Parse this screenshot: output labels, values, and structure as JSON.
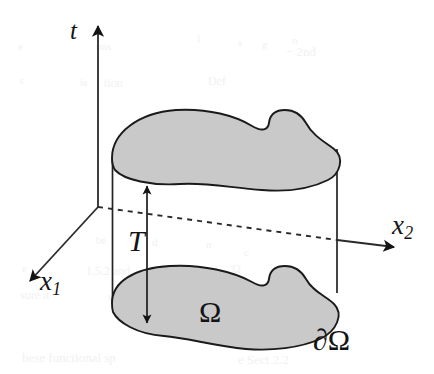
{
  "figure": {
    "kind": "space-time-cylinder",
    "caption": "",
    "width": 434,
    "height": 374,
    "background_color": "#ffffff",
    "ink_color": "#141414",
    "region_fill_color": "#c9c9c9",
    "region_stroke_color": "#1a1a1a"
  },
  "axes": {
    "origin": {
      "x": 98,
      "y": 207
    },
    "items": [
      {
        "id": "t",
        "label": "t",
        "name": "axis-t",
        "direction": "up",
        "style": "solid",
        "tip": {
          "x": 98,
          "y": 18
        },
        "tail": {
          "x": 98,
          "y": 207
        }
      },
      {
        "id": "x1",
        "label": "x",
        "subscript": "1",
        "name": "axis-x1",
        "direction": "down-left",
        "style": "solid",
        "tip": {
          "x": 25,
          "y": 286
        },
        "tail": {
          "x": 98,
          "y": 207
        }
      },
      {
        "id": "x2",
        "label": "x",
        "subscript": "2",
        "name": "axis-x2",
        "direction": "right",
        "style": "dashed-then-solid",
        "tip": {
          "x": 401,
          "y": 248
        },
        "tail": {
          "x": 98,
          "y": 207
        },
        "dashed_until": {
          "x": 337,
          "y": 240
        }
      }
    ]
  },
  "labels": {
    "t": "t",
    "x1_base": "x",
    "x1_sub": "1",
    "x2_base": "x",
    "x2_sub": "2",
    "T": "T",
    "omega": "Ω",
    "boundary_omega": "∂Ω"
  },
  "measure": {
    "name": "time-extent",
    "label": "T",
    "arrow_x": 147,
    "top_y": 180,
    "bottom_y": 329,
    "double_headed": true
  },
  "regions": [
    {
      "id": "top-cap",
      "name": "omega-top-cap",
      "description": "upper kidney-shaped cross-section at time t = T",
      "filled": true
    },
    {
      "id": "bottom-cap",
      "name": "omega-bottom-cap",
      "description": "lower kidney-shaped cross-section at time t = 0",
      "filled": true
    }
  ],
  "cylinder_walls": [
    {
      "id": "left-wall",
      "name": "cylinder-left-wall",
      "x": 112,
      "y_top": 158,
      "y_bottom": 303
    },
    {
      "id": "right-wall",
      "name": "cylinder-right-wall",
      "x": 337,
      "y_top": 150,
      "y_bottom": 292
    }
  ],
  "bleed_through_text": [
    {
      "text": "e",
      "left": 18,
      "top": 40,
      "size": 11
    },
    {
      "text": "ons",
      "left": 96,
      "top": 40,
      "size": 11
    },
    {
      "text": "1",
      "left": 196,
      "top": 32,
      "size": 11
    },
    {
      "text": "s",
      "left": 238,
      "top": 36,
      "size": 11
    },
    {
      "text": "g",
      "left": 262,
      "top": 38,
      "size": 11
    },
    {
      "text": "n",
      "left": 292,
      "top": 34,
      "size": 11
    },
    {
      "text": "− 2nd",
      "left": 286,
      "top": 44,
      "size": 13
    },
    {
      "text": "c",
      "left": 20,
      "top": 74,
      "size": 11
    },
    {
      "text": "is",
      "left": 80,
      "top": 76,
      "size": 11
    },
    {
      "text": "tion",
      "left": 104,
      "top": 76,
      "size": 12
    },
    {
      "text": "Def",
      "left": 208,
      "top": 74,
      "size": 12
    },
    {
      "text": "c",
      "left": 244,
      "top": 246,
      "size": 11
    },
    {
      "text": "be",
      "left": 96,
      "top": 234,
      "size": 11
    },
    {
      "text": "d",
      "left": 152,
      "top": 236,
      "size": 11
    },
    {
      "text": "n",
      "left": 206,
      "top": 238,
      "size": 11
    },
    {
      "text": "e",
      "left": 22,
      "top": 262,
      "size": 11
    },
    {
      "text": "1.5.2 and",
      "left": 86,
      "top": 264,
      "size": 12
    },
    {
      "text": "Ω",
      "left": 232,
      "top": 262,
      "size": 12
    },
    {
      "text": "sure it",
      "left": 20,
      "top": 288,
      "size": 12
    },
    {
      "text": "contin",
      "left": 108,
      "top": 290,
      "size": 12
    },
    {
      "text": "hese functional sp",
      "left": 22,
      "top": 350,
      "size": 13
    },
    {
      "text": "e Sect 2.2",
      "left": 238,
      "top": 352,
      "size": 13
    }
  ]
}
